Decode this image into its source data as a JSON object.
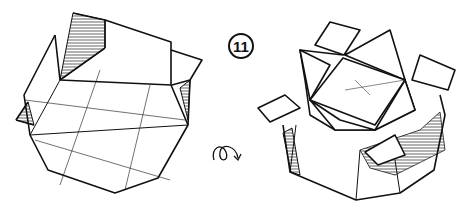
{
  "diagram": {
    "step_number": "11",
    "instruction_symbol": "turn-over-icon",
    "left_figure": "open octagonal box with two raised flaps",
    "right_figure": "octagonal box with flaps folded into star-shaped lid",
    "line_color": "#111111",
    "background": "#ffffff"
  }
}
